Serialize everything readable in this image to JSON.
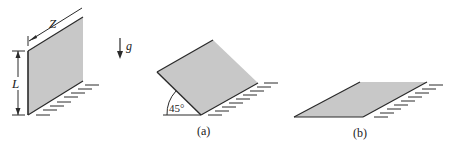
{
  "figure": {
    "colors": {
      "plate_fill": "#c8c8c8",
      "line": "#2a2a2a",
      "background": "#ffffff"
    },
    "reference_panel": {
      "width_label": "Z",
      "height_label": "L",
      "gravity_label": "g"
    },
    "panel_a": {
      "angle_label": "45°",
      "caption": "(a)"
    },
    "panel_b": {
      "caption": "(b)"
    }
  }
}
